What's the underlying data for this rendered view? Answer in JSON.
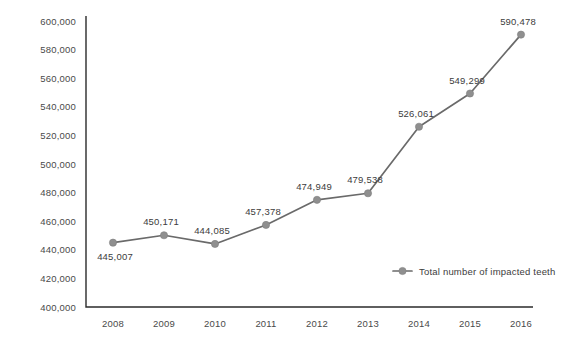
{
  "chart_data": {
    "type": "line",
    "title": "",
    "xlabel": "",
    "ylabel": "",
    "categories": [
      "2008",
      "2009",
      "2010",
      "2011",
      "2012",
      "2013",
      "2014",
      "2015",
      "2016"
    ],
    "series": [
      {
        "name": "Total number of impacted teeth",
        "values": [
          445007,
          450171,
          444085,
          457378,
          474949,
          479538,
          526061,
          549299,
          590478
        ],
        "value_labels": [
          "445,007",
          "450,171",
          "444,085",
          "457,378",
          "474,949",
          "479,538",
          "526,061",
          "549,299",
          "590,478"
        ],
        "color": "#6a6a6a",
        "marker_color": "#8f8f8f"
      }
    ],
    "ylim": [
      400000,
      600000
    ],
    "y_tick_values": [
      600000,
      580000,
      560000,
      540000,
      520000,
      500000,
      480000,
      460000,
      440000,
      420000,
      400000
    ],
    "y_tick_labels": [
      "600,000",
      "580,000",
      "560,000",
      "540,000",
      "520,000",
      "500,000",
      "480,000",
      "460,000",
      "440,000",
      "420,000",
      "400,000"
    ],
    "grid": false,
    "legend_position": "inside-bottom-right",
    "legend_entries": [
      "Total number of impacted teeth"
    ],
    "label_positions": [
      "below",
      "above",
      "above",
      "above",
      "above",
      "above",
      "above",
      "above",
      "above"
    ],
    "axis_color": "#2b2b2b",
    "background_color": "#ffffff"
  }
}
